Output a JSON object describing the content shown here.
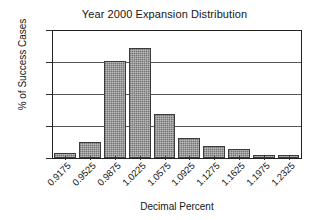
{
  "chart_data": {
    "type": "bar",
    "title": "Year 2000 Expansion Distribution",
    "xlabel": "Decimal Percent",
    "ylabel": "% of Success Cases",
    "categories": [
      "0.9175",
      "0.9525",
      "0.9875",
      "1.0225",
      "1.0575",
      "1.0925",
      "1.1275",
      "1.1625",
      "1.1975",
      "1.2325"
    ],
    "values": [
      1.7,
      5.0,
      30.7,
      34.6,
      13.8,
      6.2,
      3.9,
      2.7,
      1.0,
      1.1
    ],
    "yticks": [
      "0",
      "10",
      "20",
      "30",
      "40"
    ],
    "ylim": [
      0,
      40
    ],
    "grid": true,
    "legend": "none",
    "bar_color": "#8d8d8d",
    "bar_border_color": "#3b3b3b",
    "axis_color": "#222222",
    "background": "#ffffff"
  }
}
